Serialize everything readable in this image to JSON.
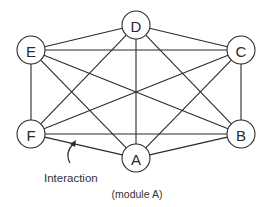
{
  "diagram": {
    "type": "complete-graph",
    "nodes": [
      {
        "id": "A",
        "label": "A",
        "x": 136,
        "y": 158
      },
      {
        "id": "B",
        "label": "B",
        "x": 241,
        "y": 134
      },
      {
        "id": "C",
        "label": "C",
        "x": 241,
        "y": 50
      },
      {
        "id": "D",
        "label": "D",
        "x": 136,
        "y": 25
      },
      {
        "id": "E",
        "label": "E",
        "x": 31,
        "y": 50
      },
      {
        "id": "F",
        "label": "F",
        "x": 31,
        "y": 134
      }
    ],
    "edges": [
      [
        "A",
        "B"
      ],
      [
        "A",
        "C"
      ],
      [
        "A",
        "D"
      ],
      [
        "A",
        "E"
      ],
      [
        "A",
        "F"
      ],
      [
        "B",
        "C"
      ],
      [
        "B",
        "D"
      ],
      [
        "B",
        "E"
      ],
      [
        "B",
        "F"
      ],
      [
        "C",
        "D"
      ],
      [
        "C",
        "E"
      ],
      [
        "C",
        "F"
      ],
      [
        "D",
        "E"
      ],
      [
        "D",
        "F"
      ],
      [
        "E",
        "F"
      ]
    ],
    "node_radius": 14,
    "annotations": {
      "interaction_label": "Interaction",
      "module_label": "(module A)"
    }
  }
}
